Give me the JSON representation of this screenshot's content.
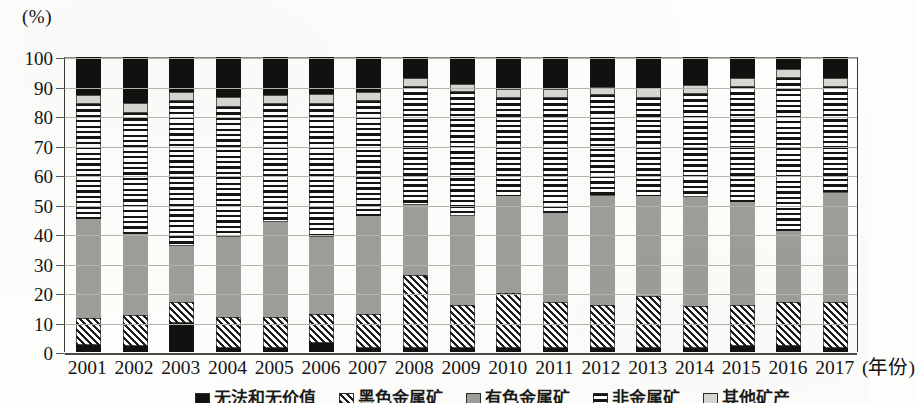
{
  "chart_data": {
    "type": "bar",
    "title": "",
    "subtitle": "",
    "xlabel": "(年份)",
    "ylabel": "(%)",
    "unit_label": "(%)",
    "stacked": true,
    "percent_stacked": true,
    "grid": true,
    "legend_position": "bottom",
    "ylim": [
      0,
      100
    ],
    "yticks": [
      0,
      10,
      20,
      30,
      40,
      50,
      60,
      70,
      80,
      90,
      100
    ],
    "ytick_labels": [
      "0",
      "10",
      "20",
      "30",
      "40",
      "50",
      "60",
      "70",
      "80",
      "90",
      "100"
    ],
    "categories": [
      "2001",
      "2002",
      "2003",
      "2004",
      "2005",
      "2006",
      "2007",
      "2008",
      "2009",
      "2010",
      "2011",
      "2012",
      "2013",
      "2014",
      "2015",
      "2016",
      "2017"
    ],
    "series": [
      {
        "name": "油气和天然气",
        "pattern": "solid-black",
        "color": "#111110",
        "values": [
          2.5,
          2.0,
          10.0,
          1.5,
          1.5,
          3.0,
          1.5,
          1.5,
          1.5,
          1.5,
          1.5,
          1.5,
          1.5,
          1.5,
          2.0,
          2.0,
          1.5
        ]
      },
      {
        "name": "黑色金属矿",
        "pattern": "diagonal-hatch",
        "color": "#1c1c1a",
        "values": [
          9.0,
          10.5,
          7.0,
          10.5,
          10.5,
          10.0,
          11.5,
          24.5,
          14.5,
          18.5,
          15.5,
          14.5,
          17.5,
          14.0,
          14.0,
          15.0,
          15.5
        ]
      },
      {
        "name": "有色金属矿",
        "pattern": "solid-gray",
        "color": "#9d9d99",
        "values": [
          33.5,
          27.5,
          19.0,
          27.0,
          32.0,
          26.0,
          33.0,
          24.0,
          30.0,
          33.0,
          30.0,
          37.0,
          34.0,
          37.0,
          35.0,
          24.0,
          37.0
        ]
      },
      {
        "name": "非金属矿",
        "pattern": "horizontal-stripe",
        "color": "#141413",
        "values": [
          39.0,
          41.0,
          49.0,
          44.0,
          40.0,
          45.0,
          39.0,
          40.0,
          42.0,
          33.0,
          39.0,
          34.0,
          33.0,
          35.0,
          39.0,
          52.0,
          36.0
        ]
      },
      {
        "name": "其他矿产",
        "pattern": "light-gray",
        "color": "#d6d6d2",
        "values": [
          3.0,
          3.5,
          3.0,
          3.5,
          3.0,
          3.5,
          3.0,
          3.0,
          3.0,
          3.0,
          3.0,
          3.0,
          3.5,
          3.0,
          3.0,
          3.0,
          3.0
        ]
      },
      {
        "name": "煤炭",
        "pattern": "solid-black-top",
        "color": "#111110",
        "values": [
          13.0,
          15.5,
          12.0,
          13.5,
          13.0,
          12.5,
          12.0,
          7.0,
          9.0,
          11.0,
          11.0,
          10.0,
          10.5,
          9.5,
          7.0,
          4.0,
          7.0
        ]
      }
    ]
  },
  "legend": {
    "items": [
      {
        "label": "无法和无价值",
        "pattern": "solid-black"
      },
      {
        "label": "黑色金属矿",
        "pattern": "diagonal-hatch"
      },
      {
        "label": "有色金属矿",
        "pattern": "solid-gray"
      },
      {
        "label": "非金属矿",
        "pattern": "horizontal-stripe"
      },
      {
        "label": "其他矿产",
        "pattern": "light-gray"
      }
    ]
  }
}
